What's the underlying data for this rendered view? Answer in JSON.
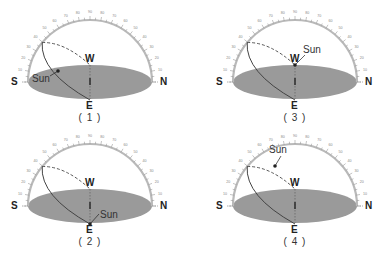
{
  "diagram": {
    "type": "celestial-sphere-sun-positions",
    "labels": {
      "south": "S",
      "north": "N",
      "west": "W",
      "east": "E",
      "sun": "Sun"
    },
    "arc_scale_degrees": [
      "10",
      "20",
      "30",
      "40",
      "50",
      "60",
      "70",
      "80",
      "90",
      "80",
      "70",
      "60",
      "50",
      "40",
      "30",
      "20",
      "10"
    ],
    "colors": {
      "horizon_disc": "#9a9a9a",
      "arc": "#b9b9b9",
      "path": "#444444",
      "text": "#222222"
    },
    "panels": [
      {
        "id": "1",
        "caption": "( 1 )",
        "sun_position": "on solid path, east-south sky, low"
      },
      {
        "id": "2",
        "caption": "( 2 )",
        "sun_position": "at east point on horizon"
      },
      {
        "id": "3",
        "caption": "( 3 )",
        "sun_position": "at west point on horizon"
      },
      {
        "id": "4",
        "caption": "( 4 )",
        "sun_position": "on dashed path toward west"
      }
    ]
  }
}
